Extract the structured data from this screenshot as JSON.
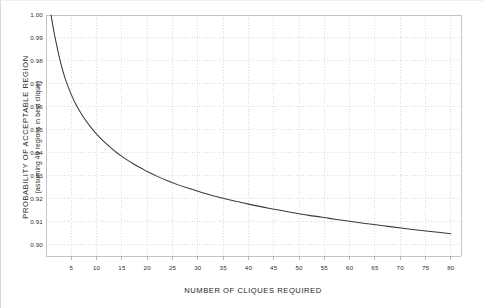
{
  "chart_data": {
    "type": "line",
    "title": "",
    "xlabel": "NUMBER OF CLIQUES REQUIRED",
    "ylabel": "PROBABILITY OF ACCEPTABLE REGION",
    "ylabel_sub": "(assuming 40 regions in best clique)",
    "xlim": [
      0,
      82
    ],
    "ylim": [
      0.895,
      1.0
    ],
    "grid": true,
    "legend": null,
    "xticks": [
      5,
      10,
      15,
      20,
      25,
      30,
      35,
      40,
      45,
      50,
      55,
      60,
      65,
      70,
      75,
      80
    ],
    "xticklabels": [
      "5",
      "10",
      "15",
      "20",
      "25",
      "30",
      "35",
      "40",
      "45",
      "50",
      "55",
      "60",
      "65",
      "70",
      "75",
      "80"
    ],
    "yticks": [
      1.0,
      0.99,
      0.98,
      0.97,
      0.96,
      0.95,
      0.94,
      0.93,
      0.92,
      0.91,
      0.9
    ],
    "yticklabels": [
      "1.00",
      "0.99",
      "0.98",
      "0.97",
      "0.96",
      "0.95",
      "0.94",
      "0.93",
      "0.92",
      "0.91",
      "0.90"
    ],
    "series": [
      {
        "name": "probability of acceptable region",
        "color": "#3a3a3a",
        "x": [
          1,
          1.5,
          2,
          2.5,
          3,
          3.5,
          4,
          5,
          6,
          7,
          8,
          9,
          10,
          11,
          12,
          13,
          14,
          15,
          16,
          17,
          18,
          19,
          20,
          22,
          24,
          26,
          28,
          30,
          32,
          34,
          36,
          38,
          40,
          44,
          48,
          52,
          56,
          60,
          64,
          68,
          72,
          76,
          80
        ],
        "y": [
          1.0,
          0.9935,
          0.988,
          0.9828,
          0.9783,
          0.9744,
          0.971,
          0.9653,
          0.9607,
          0.9569,
          0.9536,
          0.9507,
          0.9481,
          0.9458,
          0.9437,
          0.9418,
          0.94,
          0.9384,
          0.9369,
          0.9355,
          0.9342,
          0.933,
          0.9318,
          0.9297,
          0.9278,
          0.9261,
          0.9246,
          0.9232,
          0.9219,
          0.9207,
          0.9196,
          0.9186,
          0.9176,
          0.9158,
          0.9142,
          0.9127,
          0.9114,
          0.9101,
          0.9089,
          0.9078,
          0.9067,
          0.9057,
          0.9047
        ]
      }
    ]
  },
  "axes": {
    "y_title": "PROBABILITY OF ACCEPTABLE REGION",
    "y_subtitle": "(assuming 40 regions in best clique)",
    "x_title": "NUMBER OF CLIQUES REQUIRED"
  }
}
